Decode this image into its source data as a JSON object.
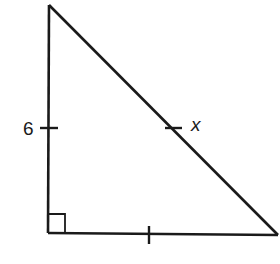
{
  "diagram": {
    "type": "right-triangle",
    "stroke_color": "#1a1a1a",
    "background": "#ffffff",
    "vertices": {
      "top": [
        50,
        5
      ],
      "right_angle": [
        48,
        233
      ],
      "right": [
        278,
        235
      ]
    },
    "labels": {
      "left_leg": "6",
      "hypotenuse": "x"
    },
    "tick_marks": [
      "left_leg",
      "hypotenuse",
      "bottom_leg"
    ],
    "right_angle_marker": true
  }
}
